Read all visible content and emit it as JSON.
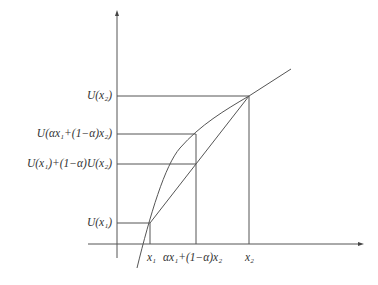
{
  "diagram": {
    "y_labels": {
      "u_x2": "U(x₂)",
      "u_mix": "U(αx₁+(1−α)x₂)",
      "u_chord": "U(x₁)+(1−α)U(x₂)",
      "u_x1": "U(x₁)"
    },
    "x_labels": {
      "x1": "x₁",
      "mix": "αx₁+(1−α)x₂",
      "x2": "x₂"
    },
    "colors": {
      "line": "#555555",
      "text": "#333333"
    }
  }
}
